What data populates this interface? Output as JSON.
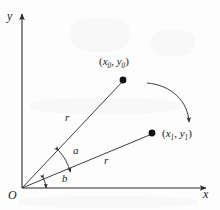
{
  "figure": {
    "type": "rotation-diagram",
    "background_color": "#fdfdfd",
    "stroke_color": "#2a2a2a",
    "axes": {
      "x_label": "x",
      "y_label": "y",
      "origin_label": "O"
    },
    "points": [
      {
        "name": "initial-point",
        "label_open": "(",
        "label_x": "x",
        "label_x_sub": "0",
        "label_comma": ", ",
        "label_y": "y",
        "label_y_sub": "0",
        "label_close": ")"
      },
      {
        "name": "rotated-point",
        "label_open": "(",
        "label_x": "x",
        "label_x_sub": "1",
        "label_comma": ", ",
        "label_y": "y",
        "label_y_sub": "1",
        "label_close": ")"
      }
    ],
    "angles": [
      {
        "name": "angle-between-rays",
        "label": "a"
      },
      {
        "name": "angle-from-x-axis",
        "label": "b"
      }
    ],
    "radii": [
      {
        "name": "upper-radius",
        "label": "r"
      },
      {
        "name": "lower-radius",
        "label": "r"
      }
    ],
    "rotation_arrow": {
      "name": "rotation-arrow",
      "direction": "clockwise"
    }
  }
}
